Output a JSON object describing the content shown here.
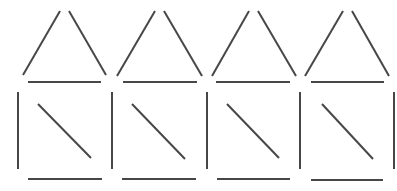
{
  "diagram": {
    "stroke_color": "#474747",
    "stroke_width": 2,
    "background": "#ffffff",
    "rows": [
      {
        "name": "triangle-row",
        "shapes": [
          {
            "type": "triangle",
            "segments": [
              {
                "role": "left-side",
                "x1": 60,
                "y1": 11,
                "x2": 23,
                "y2": 75
              },
              {
                "role": "right-side",
                "x1": 69,
                "y1": 11,
                "x2": 106,
                "y2": 75
              },
              {
                "role": "base",
                "x1": 28,
                "y1": 82,
                "x2": 101,
                "y2": 82
              }
            ]
          },
          {
            "type": "triangle",
            "segments": [
              {
                "role": "left-side",
                "x1": 155,
                "y1": 11,
                "x2": 117,
                "y2": 76
              },
              {
                "role": "right-side",
                "x1": 164,
                "y1": 11,
                "x2": 202,
                "y2": 76
              },
              {
                "role": "base",
                "x1": 123,
                "y1": 82,
                "x2": 197,
                "y2": 82
              }
            ]
          },
          {
            "type": "triangle",
            "segments": [
              {
                "role": "left-side",
                "x1": 249,
                "y1": 11,
                "x2": 212,
                "y2": 76
              },
              {
                "role": "right-side",
                "x1": 258,
                "y1": 11,
                "x2": 296,
                "y2": 76
              },
              {
                "role": "base",
                "x1": 216,
                "y1": 82,
                "x2": 290,
                "y2": 82
              }
            ]
          },
          {
            "type": "triangle",
            "segments": [
              {
                "role": "left-side",
                "x1": 343,
                "y1": 11,
                "x2": 305,
                "y2": 76
              },
              {
                "role": "right-side",
                "x1": 352,
                "y1": 11,
                "x2": 389,
                "y2": 76
              },
              {
                "role": "base",
                "x1": 311,
                "y1": 82,
                "x2": 384,
                "y2": 82
              }
            ]
          }
        ]
      },
      {
        "name": "square-row",
        "shapes": [
          {
            "type": "square-with-diagonal",
            "segments": [
              {
                "role": "left-side",
                "x1": 18,
                "y1": 92,
                "x2": 18,
                "y2": 169
              },
              {
                "role": "diagonal",
                "x1": 38,
                "y1": 104,
                "x2": 91,
                "y2": 158
              },
              {
                "role": "base",
                "x1": 28,
                "y1": 179,
                "x2": 102,
                "y2": 179
              }
            ]
          },
          {
            "type": "square-with-diagonal",
            "segments": [
              {
                "role": "left-side",
                "x1": 112,
                "y1": 92,
                "x2": 112,
                "y2": 169
              },
              {
                "role": "diagonal",
                "x1": 132,
                "y1": 104,
                "x2": 185,
                "y2": 159
              },
              {
                "role": "base",
                "x1": 122,
                "y1": 179,
                "x2": 196,
                "y2": 179
              }
            ]
          },
          {
            "type": "square-with-diagonal",
            "segments": [
              {
                "role": "left-side",
                "x1": 207,
                "y1": 92,
                "x2": 207,
                "y2": 169
              },
              {
                "role": "diagonal",
                "x1": 227,
                "y1": 104,
                "x2": 279,
                "y2": 158
              },
              {
                "role": "base",
                "x1": 217,
                "y1": 179,
                "x2": 290,
                "y2": 179
              }
            ]
          },
          {
            "type": "square-with-diagonal",
            "segments": [
              {
                "role": "left-side",
                "x1": 300,
                "y1": 92,
                "x2": 300,
                "y2": 169
              },
              {
                "role": "diagonal",
                "x1": 322,
                "y1": 104,
                "x2": 373,
                "y2": 159
              },
              {
                "role": "base",
                "x1": 311,
                "y1": 180,
                "x2": 383,
                "y2": 180
              },
              {
                "role": "right-side",
                "x1": 394,
                "y1": 92,
                "x2": 394,
                "y2": 169
              }
            ]
          }
        ]
      }
    ]
  }
}
